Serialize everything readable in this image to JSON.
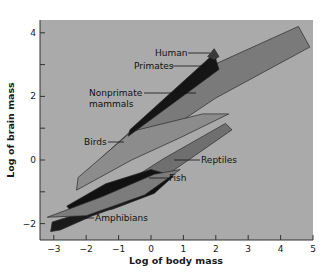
{
  "chart_data": {
    "type": "area",
    "title": "",
    "xlabel": "Log of body mass",
    "ylabel": "Log of brain mass",
    "xlim": [
      -3.2,
      5
    ],
    "ylim": [
      -2.5,
      4.4
    ],
    "x_ticks": [
      -3,
      -2,
      -1,
      0,
      1,
      2,
      3,
      4,
      5
    ],
    "x_tick_labels": [
      "−3",
      "−2",
      "−1",
      "0",
      "1",
      "2",
      "3",
      "4",
      "5"
    ],
    "y_ticks": [
      -2,
      -1,
      0,
      1,
      2,
      3,
      4
    ],
    "y_tick_labels": [
      "−2",
      "",
      "0",
      "",
      "2",
      "",
      "4"
    ],
    "grid": false,
    "background": "#a9a9a9",
    "series": [
      {
        "name": "Nonprimate mammals",
        "fill": "#7a7a7a",
        "polygon": [
          [
            -1.6,
            -0.35
          ],
          [
            -1.55,
            0.05
          ],
          [
            1.3,
            2.7
          ],
          [
            4.55,
            4.2
          ],
          [
            4.9,
            3.55
          ],
          [
            2.0,
            1.95
          ],
          [
            -0.2,
            0.45
          ],
          [
            -1.6,
            -0.35
          ]
        ]
      },
      {
        "name": "Birds",
        "fill": "#8c8c8c",
        "polygon": [
          [
            -2.3,
            -0.95
          ],
          [
            -2.25,
            -0.55
          ],
          [
            -0.6,
            0.9
          ],
          [
            1.6,
            1.45
          ],
          [
            2.4,
            1.45
          ],
          [
            0.9,
            0.7
          ],
          [
            -0.6,
            0.0
          ],
          [
            -2.3,
            -0.95
          ]
        ]
      },
      {
        "name": "Reptiles",
        "fill": "#6f6f6f",
        "polygon": [
          [
            -2.0,
            -1.5
          ],
          [
            0.4,
            0.05
          ],
          [
            2.3,
            1.15
          ],
          [
            2.5,
            0.95
          ],
          [
            0.1,
            -0.75
          ],
          [
            -1.6,
            -1.5
          ],
          [
            -2.0,
            -1.5
          ]
        ]
      },
      {
        "name": "Fish",
        "fill": "#111111",
        "polygon": [
          [
            -2.6,
            -1.45
          ],
          [
            -1.4,
            -0.75
          ],
          [
            0.0,
            -0.3
          ],
          [
            0.7,
            -0.5
          ],
          [
            0.1,
            -1.05
          ],
          [
            -1.2,
            -1.55
          ],
          [
            -2.4,
            -1.7
          ],
          [
            -2.6,
            -1.45
          ]
        ]
      },
      {
        "name": "Amphibians",
        "fill": "#1a1a1a",
        "polygon": [
          [
            -3.1,
            -2.25
          ],
          [
            -3.05,
            -1.95
          ],
          [
            -1.3,
            -1.4
          ],
          [
            -0.7,
            -1.35
          ],
          [
            -1.8,
            -1.75
          ],
          [
            -2.8,
            -2.2
          ],
          [
            -3.1,
            -2.25
          ]
        ]
      },
      {
        "name": "Fish/Amphibian band",
        "fill": "#7c7c7c",
        "polygon": [
          [
            -3.2,
            -1.8
          ],
          [
            -1.5,
            -1.15
          ],
          [
            0.1,
            -0.45
          ],
          [
            0.9,
            -0.3
          ],
          [
            -0.2,
            -1.1
          ],
          [
            -2.0,
            -1.75
          ],
          [
            -3.2,
            -1.8
          ]
        ]
      },
      {
        "name": "Primates",
        "fill": "#151515",
        "polygon": [
          [
            -0.7,
            0.75
          ],
          [
            -0.65,
            0.95
          ],
          [
            1.95,
            3.35
          ],
          [
            2.1,
            2.85
          ],
          [
            -0.7,
            0.75
          ]
        ]
      },
      {
        "name": "Human",
        "fill": "#3a3a3a",
        "polygon": [
          [
            1.75,
            3.25
          ],
          [
            1.95,
            3.5
          ],
          [
            2.1,
            3.25
          ],
          [
            1.95,
            3.15
          ],
          [
            1.75,
            3.25
          ]
        ]
      }
    ],
    "annotations": [
      {
        "text": "Human",
        "x": 1.05,
        "y": 3.4
      },
      {
        "text": "Primates",
        "x": 0.8,
        "y": 2.95
      },
      {
        "text": "Nonprimate",
        "x": -0.75,
        "y": 2.15
      },
      {
        "text": "mammals",
        "x": -0.75,
        "y": 1.75
      },
      {
        "text": "Birds",
        "x": -1.65,
        "y": 0.4
      },
      {
        "text": "Reptiles",
        "x": 1.5,
        "y": 0.0
      },
      {
        "text": "Fish",
        "x": 0.1,
        "y": -1.2
      },
      {
        "text": "Amphibians",
        "x": -2.0,
        "y": -2.0
      }
    ]
  },
  "labels": {
    "xlabel": "Log of body mass",
    "ylabel": "Log of brain mass",
    "human": "Human",
    "primates": "Primates",
    "nonprimate1": "Nonprimate",
    "nonprimate2": "mammals",
    "birds": "Birds",
    "reptiles": "Reptiles",
    "fish": "Fish",
    "amphibians": "Amphibians",
    "xt": [
      "−3",
      "−2",
      "−1",
      "0",
      "1",
      "2",
      "3",
      "4",
      "5"
    ],
    "yt": [
      "4",
      "2",
      "0",
      "−2"
    ]
  }
}
